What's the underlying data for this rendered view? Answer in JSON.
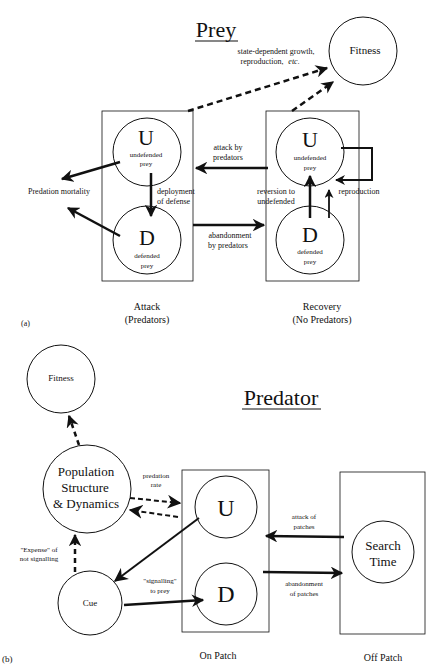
{
  "panel_a": {
    "title": "Prey",
    "label": "(a)",
    "fitness": "Fitness",
    "fitness_note_1": "state-dependent growth,",
    "fitness_note_2": "reproduction,",
    "fitness_note_etc": "etc.",
    "predation_mortality": "Predation mortality",
    "attack_box": {
      "caption_1": "Attack",
      "caption_2": "(Predators)",
      "u_letter": "U",
      "u_text_1": "undefended",
      "u_text_2": "prey",
      "d_letter": "D",
      "d_text_1": "defended",
      "d_text_2": "prey"
    },
    "recovery_box": {
      "caption_1": "Recovery",
      "caption_2": "(No Predators)",
      "u_letter": "U",
      "u_text_1": "undefended",
      "u_text_2": "prey",
      "d_letter": "D",
      "d_text_1": "defended",
      "d_text_2": "prey"
    },
    "deployment_1": "deployment",
    "deployment_2": "of defense",
    "attack_by_1": "attack by",
    "attack_by_2": "predators",
    "abandonment_1": "abandonment",
    "abandonment_2": "by predators",
    "reversion_1": "reversion to",
    "reversion_2": "undefended",
    "reproduction": "reproduction"
  },
  "panel_b": {
    "title": "Predator",
    "label": "(b)",
    "fitness": "Fitness",
    "population_1": "Population",
    "population_2": "Structure",
    "population_3": "& Dynamics",
    "predation_rate_1": "predation",
    "predation_rate_2": "rate",
    "expense_1": "\"Expense\" of",
    "expense_2": "not signalling",
    "cue": "Cue",
    "signalling_1": "\"signalling\"",
    "signalling_2": "to prey",
    "on_patch": {
      "caption": "On Patch",
      "u_letter": "U",
      "d_letter": "D"
    },
    "off_patch": {
      "caption": "Off Patch",
      "search_1": "Search",
      "search_2": "Time"
    },
    "attack_patches_1": "attack of",
    "attack_patches_2": "patches",
    "abandon_patches_1": "abandonment",
    "abandon_patches_2": "of patches"
  }
}
